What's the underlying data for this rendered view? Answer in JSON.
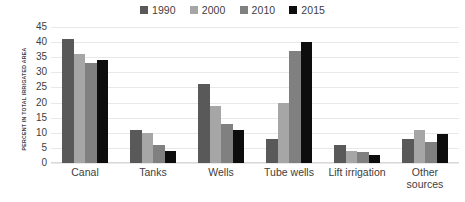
{
  "chart_data": {
    "type": "bar",
    "title": "",
    "subtitle": "",
    "xlabel": "",
    "ylabel": "PERCENT IN TOTAL IRRIGATED AREA",
    "ylim": [
      0,
      45
    ],
    "ytick_labels": [
      "45",
      "40",
      "35",
      "30",
      "25",
      "20",
      "15",
      "10",
      "5",
      "0"
    ],
    "ytick_values": [
      45,
      40,
      35,
      30,
      25,
      20,
      15,
      10,
      5,
      0
    ],
    "grid": true,
    "legend_position": "top-center",
    "categories": [
      "Canal",
      "Tanks",
      "Wells",
      "Tube wells",
      "Lift irrigation",
      "Other sources"
    ],
    "series": [
      {
        "name": "1990",
        "color": "#595959",
        "values": [
          41,
          11,
          26,
          8,
          6,
          8
        ]
      },
      {
        "name": "2000",
        "color": "#a6a6a6",
        "values": [
          36,
          10,
          19,
          20,
          4,
          11
        ]
      },
      {
        "name": "2010",
        "color": "#808080",
        "values": [
          33,
          6,
          13,
          37,
          3.5,
          7
        ]
      },
      {
        "name": "2015",
        "color": "#0d0d0d",
        "values": [
          34,
          4,
          11,
          40,
          2.5,
          9.5
        ]
      }
    ]
  },
  "legend": {
    "items": [
      {
        "label": "1990",
        "color": "#595959"
      },
      {
        "label": "2000",
        "color": "#a6a6a6"
      },
      {
        "label": "2010",
        "color": "#808080"
      },
      {
        "label": "2015",
        "color": "#0d0d0d"
      }
    ]
  },
  "axis": {
    "y_title": "PERCENT IN TOTAL IRRIGATED AREA"
  }
}
